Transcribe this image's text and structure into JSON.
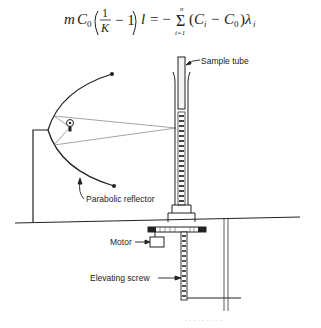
{
  "equation": {
    "lhs": "mC₀(1/K − 1) l",
    "rhs": "= −Σ(Cᵢ − C₀)λᵢ",
    "sum_upper": "n",
    "sum_lower": "i=1"
  },
  "figure": {
    "labels": {
      "sample_tube": "Sample tube",
      "parabolic_reflector": "Parabolic reflector",
      "motor": "Motor",
      "elevating_screw": "Elevating screw"
    },
    "colors": {
      "line": "#222222",
      "ray": "#666666"
    }
  },
  "caption": {
    "text": "· · ·  ·   · ·   ·  · ·"
  }
}
